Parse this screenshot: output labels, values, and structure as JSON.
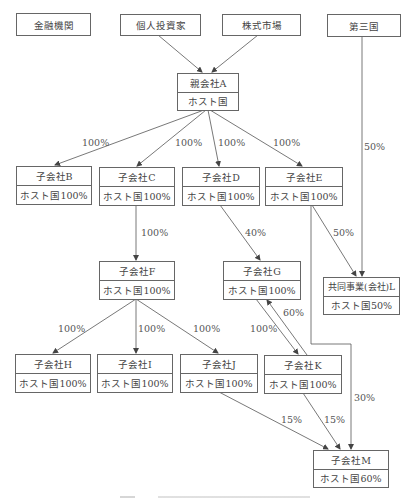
{
  "diagram": {
    "type": "ownership-structure",
    "top_entities": {
      "financial_institution": "金融機関",
      "individual_investor": "個人投資家",
      "stock_market": "株式市場",
      "third_country": "第三国"
    },
    "nodes": {
      "A": {
        "name": "親会社A",
        "sub": "ホスト国"
      },
      "B": {
        "name": "子会社B",
        "sub": "ホスト国100%"
      },
      "C": {
        "name": "子会社C",
        "sub": "ホスト国100%"
      },
      "D": {
        "name": "子会社D",
        "sub": "ホスト国100%"
      },
      "E": {
        "name": "子会社E",
        "sub": "ホスト国100%"
      },
      "F": {
        "name": "子会社F",
        "sub": "ホスト国100%"
      },
      "G": {
        "name": "子会社G",
        "sub": "ホスト国100%"
      },
      "L": {
        "name": "共同事業(会社)L",
        "sub": "ホスト国50%"
      },
      "H": {
        "name": "子会社H",
        "sub": "ホスト国100%"
      },
      "I": {
        "name": "子会社I",
        "sub": "ホスト国100%"
      },
      "J": {
        "name": "子会社J",
        "sub": "ホスト国100%"
      },
      "K": {
        "name": "子会社K",
        "sub": "ホスト国100%"
      },
      "M": {
        "name": "子会社M",
        "sub": "ホスト国60%"
      }
    },
    "edges": {
      "A_B": "100%",
      "A_C": "100%",
      "A_D": "100%",
      "A_E": "100%",
      "third_L": "50%",
      "C_F": "100%",
      "D_G": "40%",
      "E_L": "50%",
      "F_H": "100%",
      "F_I": "100%",
      "F_J": "100%",
      "G_K": "100%",
      "K_G": "60%",
      "E_M": "30%",
      "J_M": "15%",
      "K_M": "15%"
    },
    "colors": {
      "line": "#555555",
      "border": "#666666",
      "text": "#444444"
    }
  }
}
